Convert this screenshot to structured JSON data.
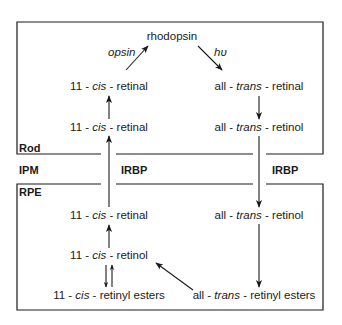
{
  "regions": {
    "rod": "Rod",
    "ipm": "IPM",
    "rpe": "RPE"
  },
  "transport": {
    "left": "IRBP",
    "right": "IRBP"
  },
  "annotations": {
    "opsin": "opsin",
    "light": "hυ"
  },
  "nodes": {
    "rhodopsin": "rhodopsin",
    "rod_cis_retinal_top": {
      "pre": "11 - ",
      "it": "cis",
      "post": " - retinal"
    },
    "rod_cis_retinal_bottom": {
      "pre": "11 - ",
      "it": "cis",
      "post": " - retinal"
    },
    "rod_trans_retinal": {
      "pre": "all - ",
      "it": "trans",
      "post": " - retinal"
    },
    "rod_trans_retinol": {
      "pre": "all - ",
      "it": "trans",
      "post": " - retinol"
    },
    "rpe_cis_retinal": {
      "pre": "11 - ",
      "it": "cis",
      "post": " - retinal"
    },
    "rpe_cis_retinol": {
      "pre": "11 - ",
      "it": "cis",
      "post": " - retinol"
    },
    "rpe_cis_esters": {
      "pre": "11 - ",
      "it": "cis",
      "post": " - retinyl esters"
    },
    "rpe_trans_retinol": {
      "pre": "all - ",
      "it": "trans",
      "post": " - retinol"
    },
    "rpe_trans_esters": {
      "pre": "all - ",
      "it": "trans",
      "post": " - retinyl esters"
    }
  },
  "colors": {
    "line": "#1a1a1a",
    "background": "#ffffff"
  }
}
